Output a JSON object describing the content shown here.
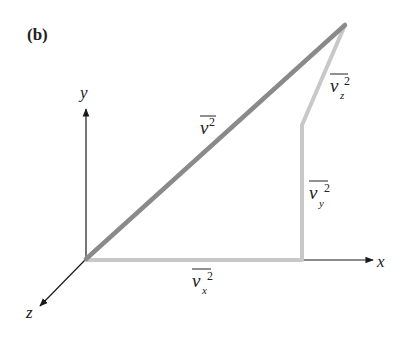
{
  "panel_label": "(b)",
  "axes": {
    "x": "x",
    "y": "y",
    "z": "z"
  },
  "vectors": {
    "total": {
      "base": "v",
      "sup": "2",
      "sub": "",
      "color": "#8a8a8a"
    },
    "vx": {
      "base": "v",
      "sup": "2",
      "sub": "x",
      "color": "#c8c8c8"
    },
    "vy": {
      "base": "v",
      "sup": "2",
      "sub": "y",
      "color": "#c8c8c8"
    },
    "vz": {
      "base": "v",
      "sup": "2",
      "sub": "z",
      "color": "#c8c8c8"
    }
  },
  "colors": {
    "axis": "#1a1a1a",
    "total_vector": "#8a8a8a",
    "component_vector": "#c8c8c8"
  }
}
